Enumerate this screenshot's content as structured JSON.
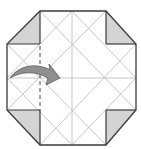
{
  "diagram": {
    "type": "origami-fold-step",
    "colors": {
      "background": "#ffffff",
      "outline": "#3a3a3a",
      "crease": "#b8b8b8",
      "flap_fill": "#d4d4d4",
      "arrow_fill": "#8f8f8f",
      "arrow_stroke": "#5a5a5a",
      "dashed_fold": "#4a4a4a"
    },
    "outline_points": [
      [
        40,
        11
      ],
      [
        106,
        11
      ],
      [
        136,
        44
      ],
      [
        136,
        110
      ],
      [
        106,
        145
      ],
      [
        40,
        145
      ],
      [
        7,
        110
      ],
      [
        7,
        44
      ]
    ],
    "corner_flaps": [
      {
        "name": "top-left",
        "points": [
          [
            40,
            11
          ],
          [
            40,
            44
          ],
          [
            7,
            44
          ]
        ]
      },
      {
        "name": "top-right",
        "points": [
          [
            106,
            11
          ],
          [
            106,
            44
          ],
          [
            136,
            44
          ]
        ]
      },
      {
        "name": "bottom-left",
        "points": [
          [
            7,
            110
          ],
          [
            40,
            110
          ],
          [
            40,
            145
          ]
        ]
      },
      {
        "name": "bottom-right",
        "points": [
          [
            136,
            110
          ],
          [
            106,
            110
          ],
          [
            106,
            145
          ]
        ]
      }
    ],
    "fold_line": {
      "type": "valley",
      "x": 40,
      "y1": 44,
      "y2": 110
    },
    "arrow": {
      "from": [
        10,
        78
      ],
      "to": [
        60,
        78
      ],
      "direction": "right"
    }
  }
}
